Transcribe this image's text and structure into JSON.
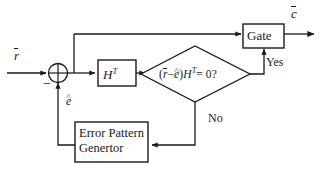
{
  "diagram": {
    "stroke_color": "#1a1a1a",
    "background": "#ffffff",
    "blocks": {
      "gate": {
        "label": "Gate"
      },
      "transpose": {
        "label_base": "H",
        "label_sup": "T"
      },
      "error_pattern_generator": {
        "line1": "Error Pattern",
        "line2": "Genertor"
      },
      "decision": {
        "open_paren": "(",
        "r_symbol": "r",
        "minus": "−",
        "e_symbol": "e",
        "close_paren": ")",
        "h_symbol": "H",
        "h_sup": "T",
        "equals_zero_q": "= 0?"
      },
      "summing_junction": {
        "sign": "−"
      }
    },
    "signals": {
      "input": "r",
      "output": "c",
      "error_estimate": "e"
    },
    "branch_labels": {
      "yes": "Yes",
      "no": "No"
    }
  }
}
